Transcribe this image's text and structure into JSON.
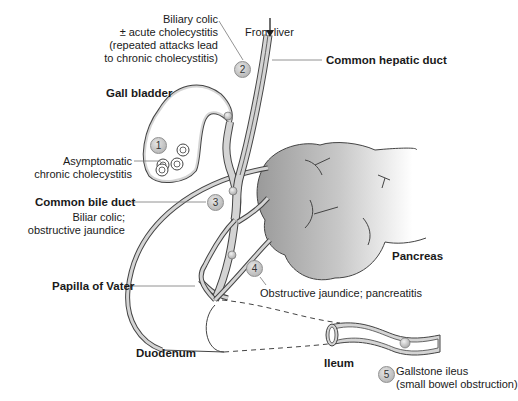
{
  "figure": {
    "labels": {
      "biliary_colic_1": "Biliary colic",
      "biliary_colic_2": "± acute cholecystitis",
      "biliary_colic_3": "(repeated attacks lead",
      "biliary_colic_4": "to chronic cholecystitis)",
      "from_liver": "From liver",
      "gall_bladder": "Gall bladder",
      "common_hepatic_duct": "Common hepatic duct",
      "asymptomatic_1": "Asymptomatic",
      "asymptomatic_2": "chronic cholecystitis",
      "common_bile_duct": "Common bile duct",
      "cbd_desc_1": "Biliar colic;",
      "cbd_desc_2": "obstructive jaundice",
      "pancreas": "Pancreas",
      "obstructive_pancreatitis": "Obstructive jaundice; pancreatitis",
      "papilla_of_vater": "Papilla of Vater",
      "duodenum": "Duodenum",
      "ileum": "Ileum",
      "gallstone_ileus_1": "Gallstone ileus",
      "gallstone_ileus_2": "(small bowel obstruction)"
    },
    "badges": [
      "1",
      "2",
      "3",
      "4",
      "5"
    ],
    "colors": {
      "duct_fill": "#d4d4d4",
      "outline": "#444444",
      "pancreas_dark": "#9a9a9a",
      "pancreas_light": "#ffffff",
      "badge": "#b8b8b8"
    }
  }
}
